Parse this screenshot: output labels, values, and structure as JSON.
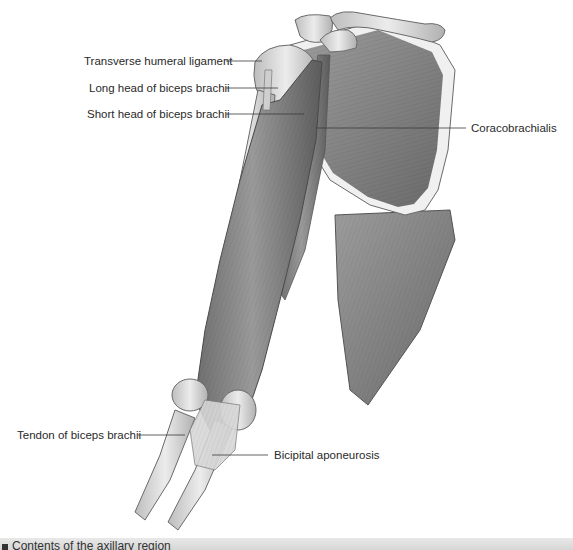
{
  "figure": {
    "labels": {
      "transverse_humeral_ligament": "Transverse humeral ligament",
      "long_head_biceps": "Long head of biceps brachii",
      "short_head_biceps": "Short head of biceps brachii",
      "coracobrachialis": "Coracobrachialis",
      "tendon_biceps": "Tendon of biceps brachii",
      "bicipital_aponeurosis": "Bicipital aponeurosis"
    },
    "colors": {
      "muscle": "#8a8a8a",
      "muscle_dark": "#5e5e5e",
      "bone": "#d9d9d9",
      "bone_outline": "#6a6a6a",
      "leader": "#3a3a3a"
    }
  },
  "caption": {
    "text": "Contents of the axillary region"
  }
}
